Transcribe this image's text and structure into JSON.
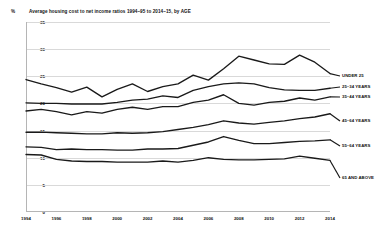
{
  "chart_data": {
    "type": "line",
    "title": "Average housing cost to net income ratios 1994–95 to 2014–15, by AGE",
    "xlabel": "",
    "ylabel": "%",
    "ylim": [
      0,
      35
    ],
    "xlim": [
      1994,
      2014
    ],
    "grid": true,
    "legend_position": "right-inline",
    "ytick_labels": [
      "0",
      "5",
      "10",
      "15",
      "20",
      "25",
      "30",
      "35"
    ],
    "ytick_values": [
      0,
      5,
      10,
      15,
      20,
      25,
      30,
      35
    ],
    "xtick_labels": [
      "1994",
      "1996",
      "1998",
      "2000",
      "2002",
      "2004",
      "2006",
      "2008",
      "2010",
      "2012",
      "2014"
    ],
    "xtick_values": [
      1994,
      1996,
      1998,
      2000,
      2002,
      2004,
      2006,
      2008,
      2010,
      2012,
      2014
    ],
    "x": [
      1994,
      1995,
      1996,
      1997,
      1998,
      1999,
      2000,
      2001,
      2002,
      2003,
      2004,
      2005,
      2006,
      2007,
      2008,
      2009,
      2010,
      2011,
      2012,
      2013,
      2014
    ],
    "series": [
      {
        "name": "UNDER 25",
        "color": "#1a1a1a",
        "values": [
          24.4,
          23.6,
          22.9,
          22.1,
          23.0,
          21.2,
          22.6,
          23.6,
          22.2,
          23.1,
          23.6,
          25.2,
          24.3,
          26.4,
          28.7,
          28.0,
          27.3,
          27.2,
          28.9,
          27.6,
          25.5
        ]
      },
      {
        "name": "25–34 YEARS",
        "color": "#1a1a1a",
        "values": [
          20.1,
          20.0,
          20.0,
          19.9,
          19.9,
          19.9,
          20.2,
          20.6,
          20.8,
          21.4,
          21.1,
          22.4,
          23.1,
          23.6,
          23.8,
          23.6,
          22.9,
          22.5,
          22.4,
          22.4,
          22.8
        ]
      },
      {
        "name": "35–44 YEARS",
        "color": "#1a1a1a",
        "values": [
          18.6,
          18.9,
          18.5,
          17.9,
          18.5,
          18.2,
          18.9,
          19.3,
          18.9,
          19.4,
          19.4,
          20.2,
          20.6,
          21.6,
          20.0,
          19.7,
          20.2,
          20.4,
          21.0,
          20.6,
          21.2
        ]
      },
      {
        "name": "45–64 YEARS",
        "color": "#1a1a1a",
        "values": [
          14.7,
          14.7,
          14.6,
          14.5,
          14.4,
          14.4,
          14.6,
          14.5,
          14.6,
          14.8,
          15.2,
          15.6,
          16.1,
          16.8,
          16.4,
          16.2,
          16.5,
          16.8,
          17.2,
          17.5,
          18.1
        ]
      },
      {
        "name": "55–64 YEARS",
        "color": "#1a1a1a",
        "values": [
          12.0,
          11.9,
          11.5,
          11.6,
          11.5,
          11.5,
          11.4,
          11.4,
          11.6,
          11.6,
          11.7,
          12.3,
          12.9,
          13.9,
          13.2,
          12.6,
          12.6,
          12.8,
          13.0,
          13.1,
          13.3
        ]
      },
      {
        "name": "65 AND ABOVE",
        "color": "#1a1a1a",
        "values": [
          10.6,
          10.5,
          9.7,
          9.4,
          9.3,
          9.3,
          9.2,
          9.2,
          9.2,
          9.4,
          9.2,
          9.5,
          10.0,
          9.7,
          9.6,
          9.6,
          9.7,
          9.8,
          10.3,
          9.9,
          9.5
        ]
      }
    ]
  }
}
